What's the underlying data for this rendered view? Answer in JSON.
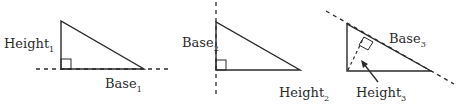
{
  "diagram": {
    "title": "",
    "stroke_color": "#2b2b2b",
    "background": "#ffffff",
    "triangles": [
      {
        "id": 1,
        "height_label": "Height",
        "height_sub": "1",
        "base_label": "Base",
        "base_sub": "1",
        "right_angle_marker": "bottom-left",
        "extended_side": "base (horizontal dashed line)"
      },
      {
        "id": 2,
        "base_label": "Base",
        "base_sub": "2",
        "height_label": "Height",
        "height_sub": "2",
        "right_angle_marker": "bottom-left",
        "extended_side": "vertical leg (vertical dashed line)"
      },
      {
        "id": 3,
        "base_label": "Base",
        "base_sub": "3",
        "height_label": "Height",
        "height_sub": "3",
        "right_angle_marker": "foot of altitude on hypotenuse",
        "extended_side": "hypotenuse (diagonal dashed line)",
        "altitude": "dashed, with arrow pointer"
      }
    ]
  }
}
